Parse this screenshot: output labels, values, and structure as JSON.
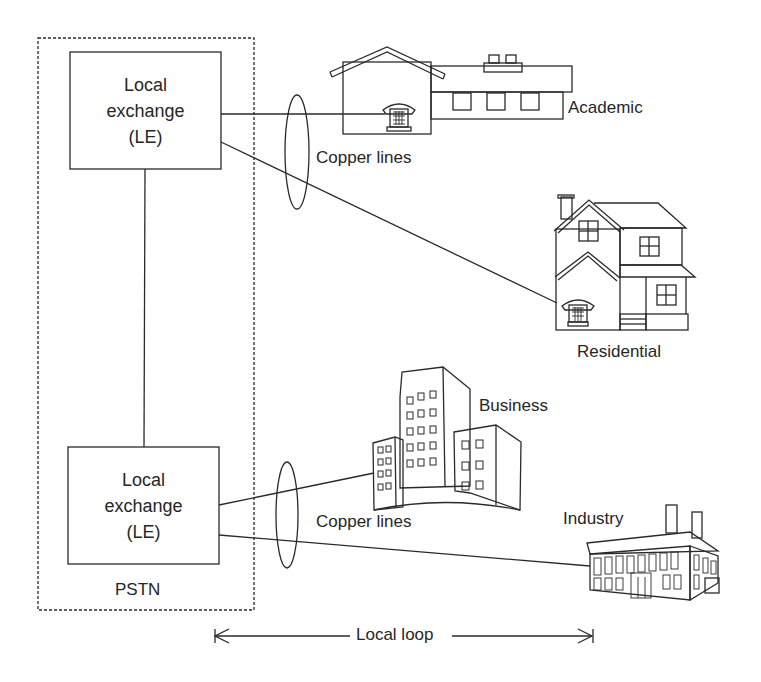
{
  "diagram": {
    "pstn": {
      "label": "PSTN"
    },
    "exchanges": [
      {
        "line1": "Local",
        "line2": "exchange",
        "line3": "(LE)"
      },
      {
        "line1": "Local",
        "line2": "exchange",
        "line3": "(LE)"
      }
    ],
    "copper_lines": [
      "Copper lines",
      "Copper lines"
    ],
    "subscribers": {
      "academic": "Academic",
      "residential": "Residential",
      "business": "Business",
      "industry": "Industry"
    },
    "local_loop": "Local loop"
  },
  "colors": {
    "stroke": "#2a2a2a",
    "background": "#ffffff"
  }
}
